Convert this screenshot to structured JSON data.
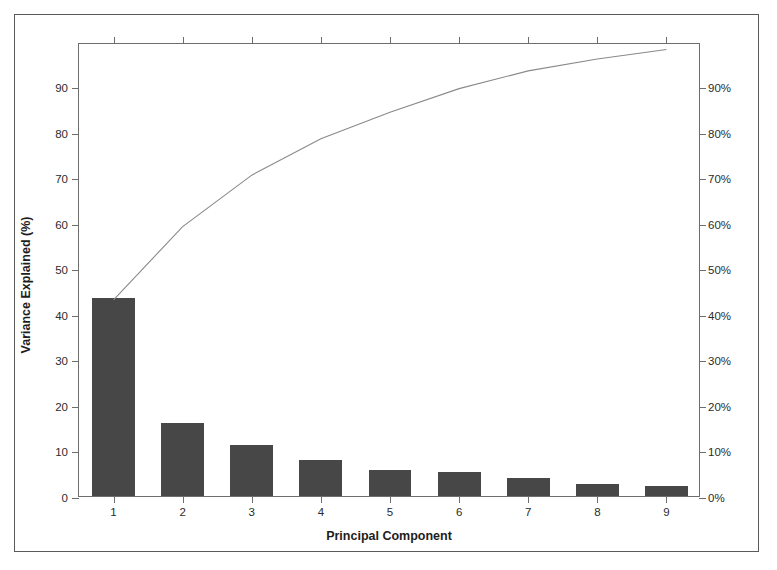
{
  "chart_data": {
    "type": "bar",
    "title": "",
    "xlabel": "Principal Component",
    "ylabel": "Variance Explained (%)",
    "categories": [
      "1",
      "2",
      "3",
      "4",
      "5",
      "6",
      "7",
      "8",
      "9"
    ],
    "values": [
      43.5,
      16.1,
      11.3,
      8.0,
      5.8,
      5.2,
      3.9,
      2.6,
      2.1
    ],
    "series": [
      {
        "name": "Variance Explained (%)",
        "type": "bar",
        "values": [
          43.5,
          16.1,
          11.3,
          8.0,
          5.8,
          5.2,
          3.9,
          2.6,
          2.1
        ]
      },
      {
        "name": "Cumulative (%)",
        "type": "line",
        "values": [
          43.5,
          59.6,
          70.9,
          78.9,
          84.7,
          89.9,
          93.8,
          96.4,
          98.5
        ]
      }
    ],
    "ylim": [
      0,
      99.7
    ],
    "ylim_right": [
      0,
      99.7
    ],
    "yticks": [
      "0",
      "10",
      "20",
      "30",
      "40",
      "50",
      "60",
      "70",
      "80",
      "90"
    ],
    "ytick_values": [
      0,
      10,
      20,
      30,
      40,
      50,
      60,
      70,
      80,
      90
    ],
    "yticks_right": [
      "0%",
      "10%",
      "20%",
      "30%",
      "40%",
      "50%",
      "60%",
      "70%",
      "80%",
      "90%"
    ],
    "ytick_right_values": [
      0,
      10,
      20,
      30,
      40,
      50,
      60,
      70,
      80,
      90
    ],
    "xticks": [
      "1",
      "2",
      "3",
      "4",
      "5",
      "6",
      "7",
      "8",
      "9"
    ],
    "grid": false,
    "legend": "none",
    "bar_color": "#474747",
    "line_color": "#8a8a8a",
    "axis_color": "#6d6d6d",
    "frame_color": "#5a5a5a",
    "background": "#ffffff"
  }
}
